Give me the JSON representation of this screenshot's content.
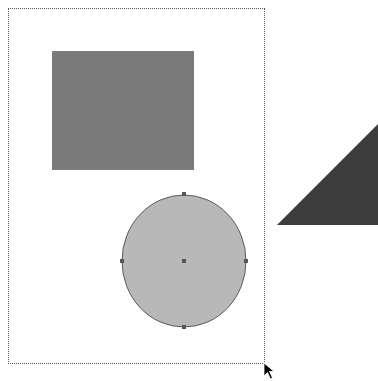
{
  "header": {
    "cutoff_text": ""
  },
  "canvas": {
    "page": {
      "x": 8,
      "y": 8,
      "width": 257,
      "height": 356,
      "border": "dotted"
    },
    "shapes": [
      {
        "type": "rectangle",
        "x": 52,
        "y": 51,
        "width": 142,
        "height": 119,
        "fill": "#7a7a7a"
      },
      {
        "type": "circle",
        "cx": 184,
        "cy": 261,
        "rx": 62,
        "ry": 66,
        "fill": "#b8b8b8",
        "stroke": "#5a5a5a",
        "selected": true,
        "handles": [
          {
            "x": 184,
            "y": 194
          },
          {
            "x": 122,
            "y": 261
          },
          {
            "x": 246,
            "y": 261
          },
          {
            "x": 184,
            "y": 327
          },
          {
            "x": 184,
            "y": 261
          }
        ]
      },
      {
        "type": "triangle",
        "points": "277,225 378,124 378,225",
        "fill": "#3d3d3d"
      }
    ],
    "cursor": {
      "type": "arrow-cursor",
      "x": 265,
      "y": 364
    }
  }
}
